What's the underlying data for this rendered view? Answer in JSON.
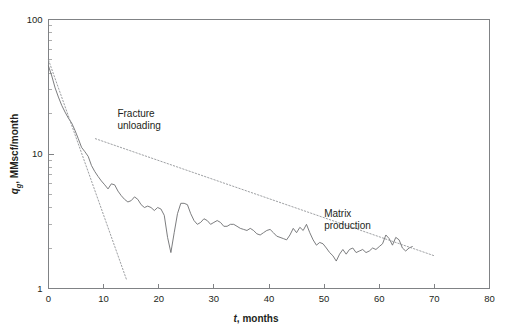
{
  "chart_data": {
    "type": "line",
    "title": "",
    "xlabel": "t, months",
    "ylabel": "q_g, MMscf/month",
    "ylabel_main": "q",
    "ylabel_sub": "g",
    "ylabel_rest": ", MMscf/month",
    "xlabel_italic": "t",
    "xlabel_rest": ", months",
    "xlim": [
      0,
      80
    ],
    "ylim": [
      1,
      100
    ],
    "yscale": "log",
    "xscale": "linear",
    "xticks": [
      0,
      10,
      20,
      30,
      40,
      50,
      60,
      70,
      80
    ],
    "xticklabels": [
      "0",
      "10",
      "20",
      "30",
      "40",
      "50",
      "60",
      "70",
      "80"
    ],
    "yticks": [
      1,
      10,
      100
    ],
    "yticklabels": [
      "1",
      "10",
      "100"
    ],
    "y_minor_ticks": [
      2,
      3,
      4,
      5,
      6,
      7,
      8,
      9,
      20,
      30,
      40,
      50,
      60,
      70,
      80,
      90
    ],
    "grid": false,
    "legend": "none",
    "line_color": "#6d6e71",
    "trend_color": "#939598",
    "axis_color": "#808285",
    "annotations": [
      {
        "id": "fracture-unloading",
        "line1": "Fracture",
        "line2": "unloading",
        "x": 12.5,
        "y": 19.0
      },
      {
        "id": "matrix-production",
        "line1": "Matrix",
        "line2": "production",
        "x": 50.0,
        "y": 3.4
      }
    ],
    "series": [
      {
        "name": "gas rate",
        "style": "solid",
        "x": [
          0.0,
          0.6,
          1.2,
          1.8,
          2.4,
          3.0,
          3.6,
          4.2,
          4.8,
          5.4,
          6.0,
          6.6,
          7.2,
          7.8,
          8.4,
          9.0,
          9.6,
          10.2,
          10.8,
          11.4,
          12.0,
          12.6,
          13.2,
          13.8,
          14.4,
          15.0,
          15.6,
          16.2,
          16.8,
          17.4,
          18.0,
          18.6,
          19.2,
          19.8,
          20.4,
          21.0,
          21.6,
          22.2,
          22.8,
          23.4,
          24.0,
          24.6,
          25.2,
          25.8,
          26.4,
          27.0,
          27.6,
          28.2,
          28.8,
          29.4,
          30.0,
          30.6,
          31.2,
          31.8,
          32.4,
          33.0,
          33.6,
          34.2,
          34.8,
          35.4,
          36.0,
          36.6,
          37.2,
          37.8,
          38.4,
          39.0,
          39.6,
          40.2,
          40.8,
          41.4,
          42.0,
          42.6,
          43.2,
          43.8,
          44.4,
          45.0,
          45.6,
          46.2,
          46.8,
          47.4,
          48.0,
          48.6,
          49.2,
          49.8,
          50.4,
          51.0,
          51.6,
          52.2,
          52.8,
          53.4,
          54.0,
          54.6,
          55.2,
          55.8,
          56.4,
          57.0,
          57.6,
          58.2,
          58.8,
          59.4,
          60.0,
          60.6,
          61.2,
          61.8,
          62.4,
          63.0,
          63.6,
          64.2,
          64.8,
          65.4,
          66.0
        ],
        "y": [
          45.0,
          38.0,
          31.0,
          26.5,
          23.0,
          20.5,
          18.5,
          17.0,
          15.0,
          13.0,
          11.2,
          10.4,
          9.6,
          8.2,
          7.4,
          6.8,
          6.3,
          5.9,
          5.5,
          6.0,
          5.9,
          5.3,
          4.9,
          4.6,
          4.4,
          4.5,
          4.8,
          4.6,
          4.2,
          4.0,
          4.1,
          4.0,
          3.8,
          4.0,
          3.9,
          3.5,
          2.4,
          1.85,
          2.6,
          3.6,
          4.3,
          4.3,
          4.2,
          3.6,
          3.2,
          3.0,
          3.1,
          3.3,
          3.2,
          3.0,
          3.1,
          3.2,
          3.1,
          2.9,
          2.9,
          3.0,
          3.0,
          2.9,
          2.8,
          2.75,
          2.7,
          2.8,
          2.7,
          2.55,
          2.5,
          2.6,
          2.7,
          2.75,
          2.6,
          2.45,
          2.4,
          2.35,
          2.3,
          2.5,
          2.8,
          2.6,
          2.85,
          2.7,
          3.0,
          2.6,
          2.3,
          2.1,
          2.2,
          2.15,
          2.0,
          1.85,
          1.75,
          1.6,
          1.8,
          1.95,
          1.8,
          1.95,
          2.0,
          1.85,
          1.9,
          1.95,
          1.85,
          1.9,
          2.0,
          1.95,
          2.05,
          2.15,
          2.5,
          2.35,
          2.1,
          2.4,
          2.3,
          2.0,
          1.9,
          2.0,
          2.05
        ]
      },
      {
        "name": "fracture unloading trend",
        "style": "dotted",
        "x": [
          0.0,
          14.2
        ],
        "y": [
          50.0,
          1.15
        ]
      },
      {
        "name": "matrix production trend",
        "style": "dotted",
        "x": [
          8.5,
          70.0
        ],
        "y": [
          13.0,
          1.75
        ]
      }
    ]
  }
}
